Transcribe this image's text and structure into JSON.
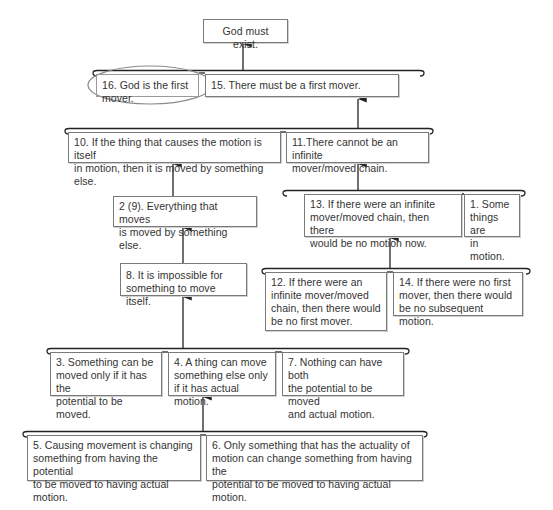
{
  "diagram": {
    "nodes": {
      "conclusion": {
        "id": "C",
        "text": "God must exist."
      },
      "n16": {
        "id": "16",
        "text": "16. God is the first mover.",
        "highlighted": true
      },
      "n15": {
        "id": "15",
        "text": "15. There must be a first mover."
      },
      "n10": {
        "id": "10",
        "text": "10. If the thing that causes the motion is itself\nin motion, then it is moved by something else."
      },
      "n11": {
        "id": "11",
        "text": "11.There cannot be an infinite\nmover/moved chain."
      },
      "n2": {
        "id": "2 (9)",
        "text": "2 (9). Everything that moves\nis moved by something else."
      },
      "n13": {
        "id": "13",
        "text": "13. If there were an infinite\nmover/moved chain, then there\nwould be no motion now."
      },
      "n1": {
        "id": "1",
        "text": "1. Some\nthings are\nin motion."
      },
      "n8": {
        "id": "8",
        "text": "8. It is impossible for\nsomething to move itself."
      },
      "n12": {
        "id": "12",
        "text": "12. If there were an\ninfinite mover/moved\nchain, then there would\nbe no first mover."
      },
      "n14": {
        "id": "14",
        "text": "14. If there were no first\nmover, then there would\nbe no subsequent motion."
      },
      "n3": {
        "id": "3",
        "text": "3. Something can be\nmoved only if it has the\npotential to be moved."
      },
      "n4": {
        "id": "4",
        "text": "4. A thing can move\nsomething else only\nif it has actual motion."
      },
      "n7": {
        "id": "7",
        "text": "7. Nothing can have both\nthe potential to be moved\nand actual motion."
      },
      "n5": {
        "id": "5",
        "text": "5. Causing movement is changing\nsomething from having the potential\nto be moved to having actual motion."
      },
      "n6": {
        "id": "6",
        "text": "6. Only something that has the actuality of\nmotion can change something from having the\npotential to be moved to having actual motion."
      }
    },
    "groups": [
      {
        "premises": [
          "16",
          "15"
        ],
        "supports": "C"
      },
      {
        "premises": [
          "10",
          "11"
        ],
        "supports": "15"
      },
      {
        "premises": [
          "13",
          "1"
        ],
        "supports": "11"
      },
      {
        "premises": [
          "12",
          "14"
        ],
        "supports": "13"
      },
      {
        "premises": [
          "3",
          "4",
          "7"
        ],
        "supports": "8"
      },
      {
        "premises": [
          "5",
          "6"
        ],
        "supports": "4"
      }
    ],
    "single_links": [
      {
        "from": "2 (9)",
        "to": "10"
      },
      {
        "from": "8",
        "to": "2 (9)"
      }
    ],
    "colors": {
      "line": "#222222",
      "box_border": "#7a7a7a",
      "highlight_ellipse": "#8a8a8a",
      "text": "#333333"
    }
  }
}
